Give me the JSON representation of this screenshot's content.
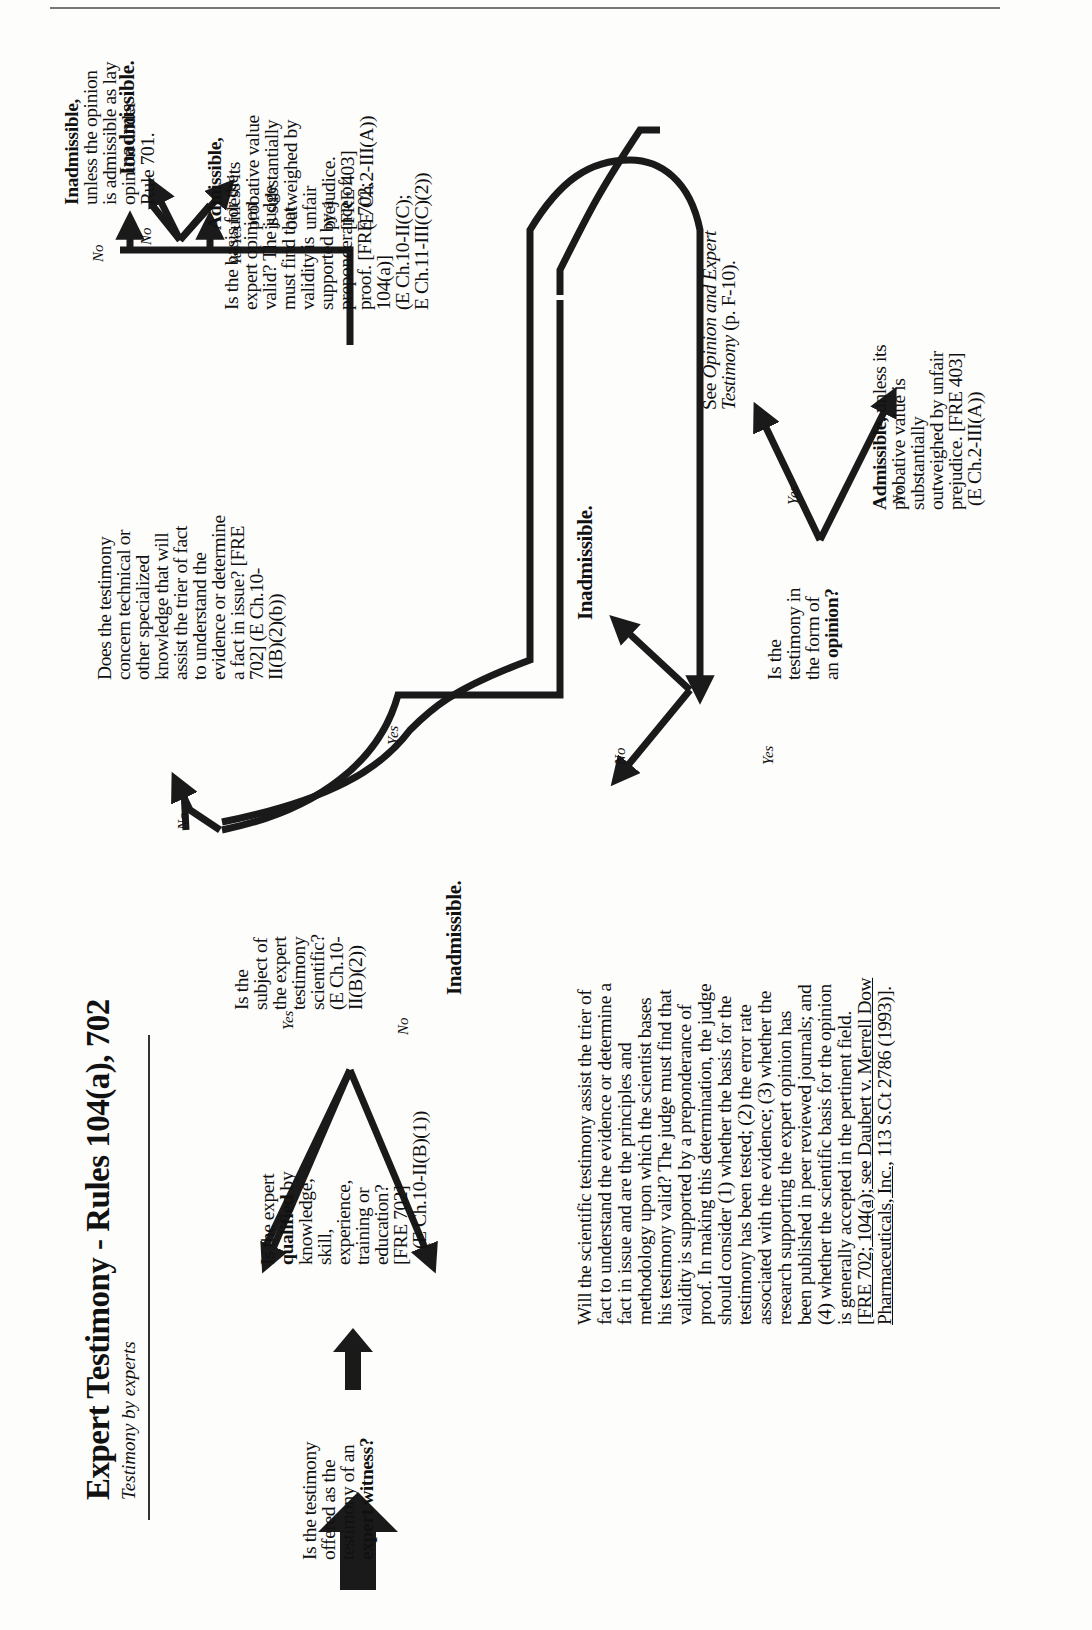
{
  "header": {
    "title": "Expert Testimony - Rules 104(a), 702",
    "subtitle": "Testimony by experts"
  },
  "nodes": {
    "start": {
      "line1": "Is the testimony",
      "line2": "offered as the",
      "line3": "testimony of an",
      "line4": "expert witness?"
    },
    "qualified": {
      "line1": "Is the expert",
      "line2_bold": "qualified",
      "line2_rest": " by",
      "line3": "knowledge,",
      "line4": "skill,",
      "line5": "experience,",
      "line6": "training or",
      "line7": "education?",
      "line8": "[FRE 702]",
      "line9": "(E Ch.10-II(B)(1))"
    },
    "inadmissible_qualified": "Inadmissible.",
    "scientific": {
      "line1": "Is the",
      "line2": "subject of",
      "line3": "the expert",
      "line4": "testimony",
      "line5": "scientific?",
      "line6": "(E Ch.10-",
      "line7": "II(B)(2))"
    },
    "specialized": {
      "line1": "Does the testimony",
      "line2": "concern technical or",
      "line3": "other specialized",
      "line4": "knowledge that will",
      "line5": "assist the trier of fact",
      "line6": "to understand the",
      "line7": "evidence or determine",
      "line8": "a fact in issue? [FRE",
      "line9": "702]  (E Ch.10-",
      "line10": "II(B)(2)(b))"
    },
    "inadmissible_lay": {
      "bold": "Inadmissible,",
      "line2": "unless the opinion",
      "line3": "is admissible as lay",
      "line4": "opinion under",
      "line5": "Rule 701."
    },
    "basis_valid": {
      "line1": "Is the basis for the",
      "line2": "expert opinion",
      "line3": "valid?  The judge",
      "line4": "must find that",
      "line5": "validity is",
      "line6": "supported by a",
      "line7": "preponderance of",
      "line8": "proof. [FRE 702;",
      "line9": "104(a)]",
      "line10": "(E Ch.10-II(C);",
      "line11": "E Ch.11-III(C)(2))"
    },
    "inadmissible_basis": "Inadmissible.",
    "admissible_basis": {
      "bold": "Admissible,",
      "line2": "unless its",
      "line3": "probative value",
      "line4": "is substantially",
      "line5": "outweighed by",
      "line6": "unfair",
      "line7": "prejudice.",
      "line8": "[FRE 403]",
      "line9": "(E Ch.2-III(A))"
    },
    "daubert": {
      "line1": "Will the scientific testimony assist the trier of",
      "line2": "fact to understand the evidence or determine a",
      "line3": "fact in issue and are the principles and",
      "line4": "methodology upon which the scientist bases",
      "line5": "his testimony valid?  The judge must find that",
      "line6": "validity is supported by a preponderance of",
      "line7": "proof. In making this determination, the judge",
      "line8": "should consider (1) whether the basis for the",
      "line9": "testimony has been tested; (2) the error rate",
      "line10": "associated with the evidence; (3) whether the",
      "line11": "research supporting the expert opinion has",
      "line12": "been published in peer reviewed journals; and",
      "line13": "(4) whether the scientific basis for the opinion",
      "line14": "is generally accepted in the pertinent field.",
      "line15a": "[FRE 702; 104(a); see ",
      "line15b": "Daubert v. Merrell Dow",
      "line16a": "Pharmaceuticals, Inc.",
      "line16b": ", 113 S.Ct 2786 (1993)]."
    },
    "inadmissible_daubert": "Inadmissible.",
    "opinion_form": {
      "line1": "Is the",
      "line2": "testimony in",
      "line3": "the form of",
      "line4a": "an ",
      "line4b": "opinion?"
    },
    "see_opinion": {
      "pre": "See ",
      "italic1": "Opinion and Expert",
      "italic2": "Testimony",
      "post": " (p. F-10)."
    },
    "admissible_final": {
      "bold": "Admissible,",
      "line1rest": " unless its",
      "line2": "probative value is",
      "line3": "substantially",
      "line4": "outweighed by unfair",
      "line5": "prejudice. [FRE 403]",
      "line6": "(E Ch.2-III(A))"
    }
  },
  "branch_labels": {
    "yes": "Yes",
    "no": "No"
  },
  "colors": {
    "ink": "#111111",
    "paper": "#fdfdfc",
    "arrow": "#1a1a1a"
  }
}
